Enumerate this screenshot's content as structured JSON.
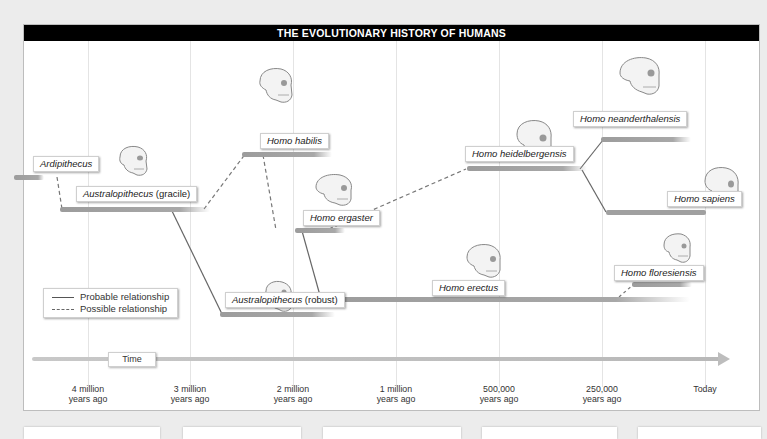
{
  "diagram": {
    "title": "THE EVOLUTIONARY HISTORY OF HUMANS",
    "legend": {
      "probable": "Probable relationship",
      "possible": "Possible relationship"
    },
    "time_label": "Time",
    "time_ticks": [
      {
        "line1": "4 million",
        "line2": "years ago"
      },
      {
        "line1": "3 million",
        "line2": "years ago"
      },
      {
        "line1": "2 million",
        "line2": "years ago"
      },
      {
        "line1": "1 million",
        "line2": "years ago"
      },
      {
        "line1": "500,000",
        "line2": "years ago"
      },
      {
        "line1": "250,000",
        "line2": "years ago"
      },
      {
        "line1": "Today",
        "line2": ""
      }
    ],
    "species": [
      {
        "genus": "Ardipithecus",
        "suffix": ""
      },
      {
        "genus": "Australopithecus",
        "suffix": " (gracile)"
      },
      {
        "genus": "Homo habilis",
        "suffix": ""
      },
      {
        "genus": "Homo ergaster",
        "suffix": ""
      },
      {
        "genus": "Australopithecus",
        "suffix": " (robust)"
      },
      {
        "genus": "Homo heidelbergensis",
        "suffix": ""
      },
      {
        "genus": "Homo neanderthalensis",
        "suffix": ""
      },
      {
        "genus": "Homo sapiens",
        "suffix": ""
      },
      {
        "genus": "Homo erectus",
        "suffix": ""
      },
      {
        "genus": "Homo floresiensis",
        "suffix": ""
      }
    ],
    "colors": {
      "title_bg": "#000000",
      "bar": "#a0a0a0",
      "line": "#666666",
      "grid": "#e4e4e4"
    }
  }
}
